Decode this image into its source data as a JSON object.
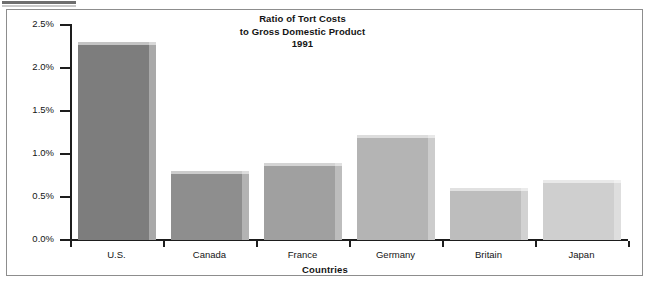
{
  "chart_data": {
    "type": "bar",
    "title": "Ratio of Tort Costs to Gross Domestic Product 1991",
    "title_lines": [
      "Ratio of Tort Costs",
      "to Gross Domestic Product",
      "1991"
    ],
    "xlabel": "Countries",
    "ylabel": "",
    "categories": [
      "U.S.",
      "Canada",
      "France",
      "Germany",
      "Britain",
      "Japan"
    ],
    "values": [
      2.3,
      0.8,
      0.9,
      1.22,
      0.6,
      0.7
    ],
    "value_unit": "%",
    "ylim": [
      0.0,
      2.5
    ],
    "ytick_values": [
      0.0,
      0.5,
      1.0,
      1.5,
      2.0,
      2.5
    ],
    "ytick_labels": [
      "0.0%",
      "0.5%",
      "1.0%",
      "1.5%",
      "2.0%",
      "2.5%"
    ],
    "grid": false,
    "legend": null,
    "bar_colors": [
      "#7d7d7d",
      "#8e8e8e",
      "#a0a0a0",
      "#b4b4b4",
      "#bdbdbd",
      "#cfcfcf"
    ],
    "bar_side_colors": [
      "#a9a9a9",
      "#b3b3b3",
      "#bdbdbd",
      "#cccccc",
      "#d2d2d2",
      "#dedede"
    ],
    "axis_color": "#1d1d1d",
    "frame_color": "#8d8d8d",
    "background": "#ffffff"
  },
  "figure": {
    "title_line_1": "Ratio of Tort Costs",
    "title_line_2": "to Gross Domestic Product",
    "title_line_3": "1991",
    "x_axis_title": "Countries",
    "y_ticks": [
      {
        "label": "2.5%",
        "value": 2.5
      },
      {
        "label": "2.0%",
        "value": 2.0
      },
      {
        "label": "1.5%",
        "value": 1.5
      },
      {
        "label": "1.0%",
        "value": 1.0
      },
      {
        "label": "0.5%",
        "value": 0.5
      },
      {
        "label": "0.0%",
        "value": 0.0
      }
    ],
    "bars": [
      {
        "label": "U.S.",
        "value": 2.3
      },
      {
        "label": "Canada",
        "value": 0.8
      },
      {
        "label": "France",
        "value": 0.9
      },
      {
        "label": "Germany",
        "value": 1.22
      },
      {
        "label": "Britain",
        "value": 0.6
      },
      {
        "label": "Japan",
        "value": 0.7
      }
    ]
  }
}
